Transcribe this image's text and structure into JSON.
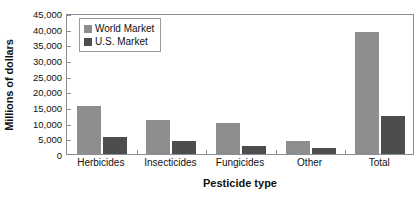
{
  "chart_data": {
    "type": "bar",
    "title": "",
    "xlabel": "Pesticide type",
    "ylabel": "Millions of dollars",
    "categories": [
      "Herbicides",
      "Insecticides",
      "Fungicides",
      "Other",
      "Total"
    ],
    "series": [
      {
        "name": "World Market",
        "color": "#8e8e8e",
        "values": [
          15300,
          10700,
          10000,
          4000,
          39000
        ]
      },
      {
        "name": "U.S. Market",
        "color": "#4d4d4d",
        "values": [
          5300,
          4200,
          2400,
          1800,
          12000
        ]
      }
    ],
    "ylim": [
      0,
      45000
    ],
    "yticks": [
      0,
      5000,
      10000,
      15000,
      20000,
      25000,
      30000,
      35000,
      40000,
      45000
    ],
    "ytick_labels": [
      "0",
      "5,000",
      "10,000",
      "15,000",
      "20,000",
      "25,000",
      "30,000",
      "35,000",
      "40,000",
      "45,000"
    ],
    "grid": false,
    "legend_position": "upper left",
    "annotations": []
  },
  "legend": {
    "items": [
      {
        "label": "World Market"
      },
      {
        "label": "U.S. Market"
      }
    ]
  }
}
